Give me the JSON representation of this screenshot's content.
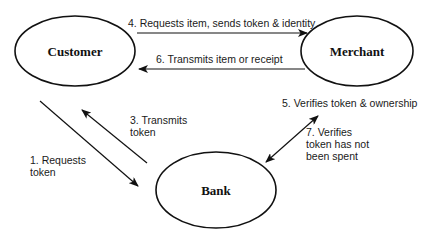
{
  "diagram": {
    "nodes": [
      {
        "id": "customer",
        "label": "Customer"
      },
      {
        "id": "merchant",
        "label": "Merchant"
      },
      {
        "id": "bank",
        "label": "Bank"
      }
    ],
    "edges": [
      {
        "id": "e1",
        "from": "customer",
        "to": "bank",
        "lines": [
          "1. Requests",
          "token"
        ]
      },
      {
        "id": "e3",
        "from": "bank",
        "to": "customer",
        "lines": [
          "3. Transmits",
          "token"
        ]
      },
      {
        "id": "e4",
        "from": "customer",
        "to": "merchant",
        "lines": [
          "4. Requests item, sends token & identity"
        ]
      },
      {
        "id": "e5",
        "from": "merchant",
        "to": "bank",
        "lines": [
          "5. Verifies token & ownership"
        ]
      },
      {
        "id": "e6",
        "from": "merchant",
        "to": "customer",
        "lines": [
          "6. Transmits item or receipt"
        ]
      },
      {
        "id": "e7",
        "from": "bank",
        "to": "merchant",
        "lines": [
          "7. Verifies",
          "token has not",
          "been spent"
        ]
      }
    ]
  }
}
